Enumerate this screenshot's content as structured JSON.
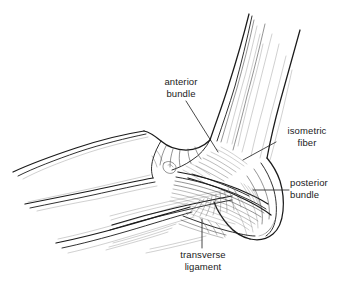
{
  "figure": {
    "name": "elbow-medial-collateral-ligament-diagram",
    "background_color": "#ffffff",
    "ink_color": "#1a1a1a",
    "width": 341,
    "height": 283
  },
  "labels": [
    {
      "id": "anterior-bundle",
      "line1": "anterior",
      "line2": "bundle",
      "leader": "diagonal line from label down-right to the anterior ligament fibers"
    },
    {
      "id": "isometric-fiber",
      "line1": "isometric",
      "line2": "fiber",
      "leader": "diagonal line from label down-left to the isometric fiber band"
    },
    {
      "id": "posterior-bundle",
      "line1": "posterior",
      "line2": "bundle",
      "leader": "horizontal line from label left to the olecranon / posterior ligament"
    },
    {
      "id": "transverse-ligament",
      "line1": "transverse",
      "line2": "ligament",
      "leader": "vertical line from label up to the transverse ligament fibers"
    }
  ],
  "structures": [
    {
      "id": "humerus-shaft",
      "name": "humerus shaft"
    },
    {
      "id": "medial-epicondyle",
      "name": "medial epicondyle"
    },
    {
      "id": "olecranon",
      "name": "olecranon process of ulna"
    },
    {
      "id": "ulna-shaft",
      "name": "ulna shaft"
    },
    {
      "id": "radius-shaft",
      "name": "radius shaft"
    },
    {
      "id": "ucl-fiber-fan",
      "name": "ulnar collateral ligament fiber fan"
    }
  ]
}
